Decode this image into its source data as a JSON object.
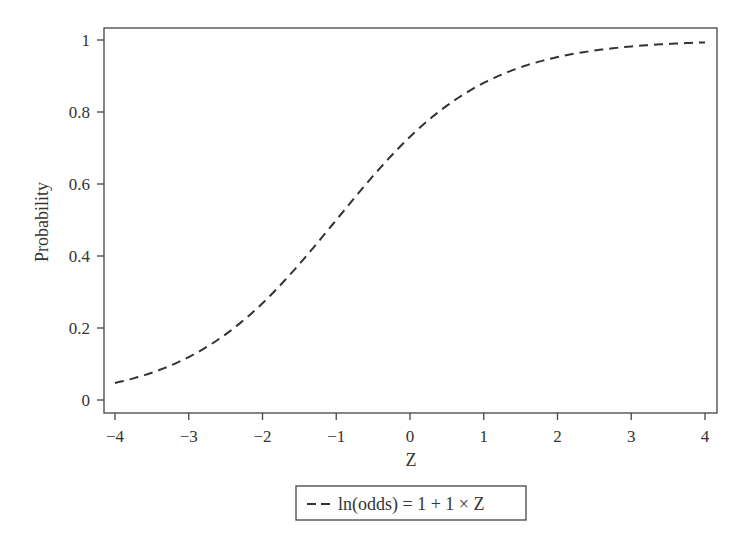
{
  "chart_data": {
    "type": "line",
    "title": "",
    "xlabel": "Z",
    "ylabel": "Probability",
    "xlim": [
      -4,
      4
    ],
    "ylim": [
      0,
      1
    ],
    "xticks": [
      "-4",
      "-3",
      "-2",
      "-1",
      "0",
      "1",
      "2",
      "3",
      "4"
    ],
    "yticks": [
      "0",
      "0.2",
      "0.4",
      "0.6",
      "0.8",
      "1"
    ],
    "grid": false,
    "legend_position": "bottom",
    "series": [
      {
        "name": "ln(odds) = 1 + 1 × Z",
        "style": "dashed",
        "color": "#333333",
        "x": [
          -4,
          -3.5,
          -3,
          -2.5,
          -2,
          -1.5,
          -1,
          -0.5,
          0,
          0.5,
          1,
          1.5,
          2,
          2.5,
          3,
          3.5,
          4
        ],
        "y": [
          0.047,
          0.076,
          0.119,
          0.182,
          0.269,
          0.378,
          0.5,
          0.622,
          0.731,
          0.818,
          0.881,
          0.924,
          0.953,
          0.971,
          0.982,
          0.989,
          0.993
        ]
      }
    ]
  },
  "labels": {
    "xlabel": "Z",
    "ylabel": "Probability",
    "legend": "ln(odds) = 1 + 1 × Z",
    "xticks": [
      "−4",
      "−3",
      "−2",
      "−1",
      "0",
      "1",
      "2",
      "3",
      "4"
    ],
    "yticks": [
      "0",
      "0.2",
      "0.4",
      "0.6",
      "0.8",
      "1"
    ]
  }
}
